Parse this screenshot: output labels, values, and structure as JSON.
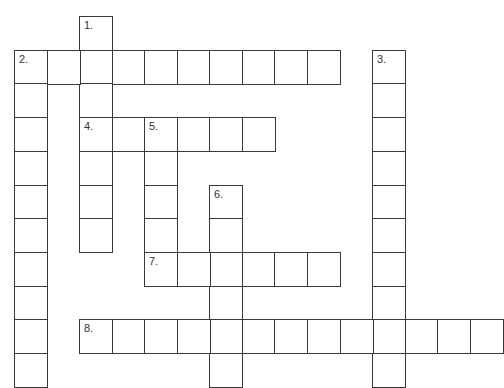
{
  "puzzle": {
    "type": "crossword",
    "grid": {
      "origin_x": 14,
      "origin_y": 16,
      "cell_w": 32.55,
      "cell_h": 33.7,
      "line_color": "#3a3a3a"
    },
    "entries": [
      {
        "number": "1.",
        "direction": "down",
        "col": 2,
        "row": 0,
        "length": 7
      },
      {
        "number": "2.",
        "direction": "across",
        "col": 0,
        "row": 1,
        "length": 10
      },
      {
        "number": "2.",
        "direction": "down",
        "col": 0,
        "row": 1,
        "length": 10,
        "label": false
      },
      {
        "number": "3.",
        "direction": "down",
        "col": 11,
        "row": 1,
        "length": 10
      },
      {
        "number": "4.",
        "direction": "across",
        "col": 2,
        "row": 3,
        "length": 6
      },
      {
        "number": "5.",
        "direction": "down",
        "col": 4,
        "row": 3,
        "length": 5
      },
      {
        "number": "6.",
        "direction": "down",
        "col": 6,
        "row": 5,
        "length": 6
      },
      {
        "number": "7.",
        "direction": "across",
        "col": 4,
        "row": 7,
        "length": 6
      },
      {
        "number": "8.",
        "direction": "across",
        "col": 2,
        "row": 9,
        "length": 13
      }
    ]
  }
}
